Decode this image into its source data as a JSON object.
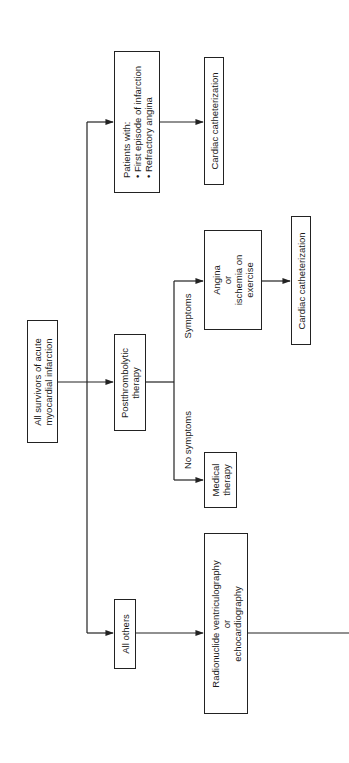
{
  "diagram": {
    "orientation": "rotated-90-ccw",
    "nodes": {
      "root": {
        "lines": [
          "All survivors of acute",
          "myocardial infarction"
        ]
      },
      "patients_with": {
        "heading": "Patients with:",
        "bullets": [
          "First episode of infarction",
          "Refractory angina"
        ]
      },
      "cardiac_cath_1": {
        "lines": [
          "Cardiac catheterization"
        ]
      },
      "postthrombolytic": {
        "lines": [
          "Postthrombolytic",
          "therapy"
        ]
      },
      "angina_ischemia": {
        "lines": [
          "Angina",
          "or",
          "ischemia on",
          "exercise"
        ]
      },
      "cardiac_cath_2": {
        "lines": [
          "Cardiac catheterization"
        ]
      },
      "medical_therapy": {
        "lines": [
          "Medical",
          "therapy"
        ]
      },
      "all_others": {
        "lines": [
          "All others"
        ]
      },
      "radionuclide": {
        "lines": [
          "Radionuclide ventriculography",
          "or",
          "echocardiography"
        ]
      }
    },
    "edge_labels": {
      "symptoms": "Symptoms",
      "no_symptoms": "No symptoms"
    },
    "colors": {
      "line": "#222222",
      "background": "#ffffff"
    }
  }
}
